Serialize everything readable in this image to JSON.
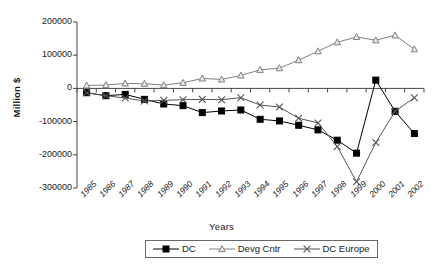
{
  "chart_data": {
    "type": "line",
    "title": "",
    "xlabel": "Years",
    "ylabel": "Million $",
    "categories": [
      "1985",
      "1986",
      "1987",
      "1988",
      "1989",
      "1990",
      "1991",
      "1992",
      "1993",
      "1994",
      "1995",
      "1996",
      "1997",
      "1998",
      "1999",
      "2000",
      "2001",
      "2002"
    ],
    "ylim": [
      -300000,
      200000
    ],
    "yticks": [
      200000,
      100000,
      0,
      -100000,
      -200000,
      -300000
    ],
    "ytick_labels": [
      "200000",
      "100000",
      "0",
      "-100000",
      "-200000",
      "-300000"
    ],
    "grid": false,
    "legend_position": "bottom",
    "series": [
      {
        "name": "DC",
        "marker": "filled-square",
        "color": "#000000",
        "values": [
          -13000,
          -22000,
          -18000,
          -33000,
          -47000,
          -52000,
          -73000,
          -68000,
          -65000,
          -93000,
          -98000,
          -111000,
          -125000,
          -156000,
          -195000,
          25000,
          -69000,
          -136000
        ]
      },
      {
        "name": "Devg Cntr",
        "marker": "triangle",
        "color": "#808080",
        "values": [
          9000,
          10000,
          15000,
          14000,
          10000,
          17000,
          30000,
          27000,
          39000,
          56000,
          61000,
          85000,
          112000,
          139000,
          155000,
          145000,
          160000,
          118000
        ]
      },
      {
        "name": "DC Europe",
        "marker": "cross",
        "color": "#555555",
        "values": [
          -13000,
          -22000,
          -29000,
          -38000,
          -36000,
          -34000,
          -33000,
          -34000,
          -28000,
          -50000,
          -56000,
          -90000,
          -104000,
          -175000,
          -281000,
          -163000,
          -69000,
          -28000
        ]
      }
    ]
  },
  "legend": {
    "items": [
      {
        "label": "DC",
        "marker": "filled-square"
      },
      {
        "label": "Devg Cntr",
        "marker": "triangle"
      },
      {
        "label": "DC Europe",
        "marker": "cross"
      }
    ]
  }
}
